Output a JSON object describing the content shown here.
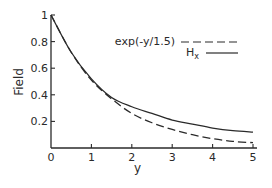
{
  "chart_data": {
    "type": "line",
    "title": "",
    "xlabel": "y",
    "ylabel": "Field",
    "xlim": [
      0,
      5
    ],
    "ylim": [
      0,
      1
    ],
    "grid": false,
    "legend_position": "top-right",
    "x_ticks": [
      "0",
      "1",
      "2",
      "3",
      "4",
      "5"
    ],
    "y_ticks": [
      "0.2",
      "0.4",
      "0.6",
      "0.8",
      "1"
    ],
    "series": [
      {
        "name": "exp(-y/1.5)",
        "style": "dashed",
        "x": [
          0,
          0.5,
          1,
          1.5,
          2,
          2.5,
          3,
          3.5,
          4,
          4.5,
          5
        ],
        "values": [
          1.0,
          0.72,
          0.51,
          0.37,
          0.26,
          0.19,
          0.14,
          0.1,
          0.07,
          0.05,
          0.04
        ]
      },
      {
        "name": "H_x",
        "style": "solid",
        "x": [
          0,
          0.5,
          1,
          1.5,
          2,
          2.5,
          3,
          3.5,
          4,
          4.5,
          5
        ],
        "values": [
          1.0,
          0.72,
          0.52,
          0.38,
          0.31,
          0.26,
          0.21,
          0.18,
          0.15,
          0.13,
          0.12
        ]
      }
    ]
  },
  "labels": {
    "xlabel": "y",
    "ylabel": "Field",
    "legend_exp": "exp(-y/1.5)",
    "legend_h": "H",
    "legend_h_sub": "x"
  }
}
